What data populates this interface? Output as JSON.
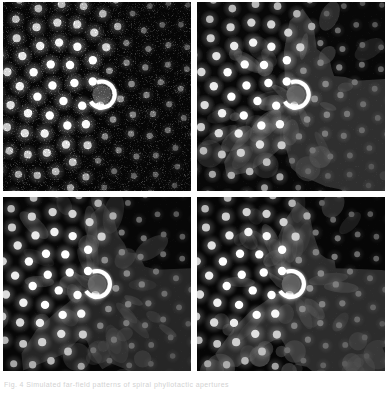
{
  "figure": {
    "layout": "2x2 grid",
    "background_color": "#ffffff",
    "panel_gap_color": "#ffffff",
    "caption": "Fig. 4  Simulated far-field patterns of spiral phyllotactic apertures",
    "panels": [
      {
        "id": "panel-tl",
        "position": "top-left",
        "label": "(a)",
        "description": "High-contrast speckled diffraction pattern, bright spiral dot lattice on noisy black field",
        "background_color": "#060606",
        "dot_color": "#ffffff",
        "halo_color": "#9a9a9a",
        "noise_level": 0.55,
        "noise_color": "#3a3a3a",
        "blur_px": 0.0,
        "lobe_opacity": 0.0,
        "center_x_frac": 0.525,
        "center_y_frac": 0.49,
        "ring_radius_px": 13,
        "ring_thickness_px": 4
      },
      {
        "id": "panel-tr",
        "position": "top-right",
        "label": "(b)",
        "description": "Smoothed reconstruction, bright spiral dots over broad grey lobes on black",
        "background_color": "#080808",
        "dot_color": "#ffffff",
        "halo_color": "#8a8a8a",
        "noise_level": 0.1,
        "noise_color": "#2a2a2a",
        "blur_px": 0.6,
        "lobe_opacity": 0.52,
        "lobe_color": "#555555",
        "center_x_frac": 0.525,
        "center_y_frac": 0.49,
        "ring_radius_px": 13,
        "ring_thickness_px": 4
      },
      {
        "id": "panel-bl",
        "position": "bottom-left",
        "label": "(c)",
        "description": "Lower-intensity reconstruction with large dark grey lobe covering lower-left quadrant",
        "background_color": "#070707",
        "dot_color": "#f4f4f4",
        "halo_color": "#7c7c7c",
        "noise_level": 0.08,
        "noise_color": "#282828",
        "blur_px": 0.8,
        "lobe_opacity": 0.46,
        "lobe_color": "#4d4d4d",
        "center_x_frac": 0.5,
        "center_y_frac": 0.5,
        "ring_radius_px": 13,
        "ring_thickness_px": 4
      },
      {
        "id": "panel-br",
        "position": "bottom-right",
        "label": "(d)",
        "description": "Reconstruction with prominent large diffuse blobs in lower half and bright spiral dots above",
        "background_color": "#060606",
        "dot_color": "#ffffff",
        "halo_color": "#8f8f8f",
        "noise_level": 0.07,
        "noise_color": "#262626",
        "blur_px": 0.9,
        "lobe_opacity": 0.5,
        "lobe_color": "#525252",
        "center_x_frac": 0.5,
        "center_y_frac": 0.5,
        "ring_radius_px": 13,
        "ring_thickness_px": 4
      }
    ]
  },
  "chart_data": {
    "type": "scatter",
    "xlabel": "",
    "ylabel": "",
    "xlim": [
      -1,
      1
    ],
    "ylim": [
      -1,
      1
    ],
    "grid": false,
    "legend_position": "none",
    "generator": {
      "model": "fermat-spiral-phyllotaxis",
      "golden_angle_deg": 137.508,
      "n_points": 210,
      "radius_scale": 11.2,
      "radius_exponent": 0.5,
      "dot_radius_min_px": 1.6,
      "dot_radius_max_px": 4.2,
      "brightness_falloff": 1.45,
      "angular_bright_sector_deg": [
        95,
        285
      ],
      "center_ring": {
        "radius_px": 13,
        "thickness_px": 4,
        "gap_angle_deg": [
          300,
          40
        ]
      }
    },
    "series": [
      {
        "name": "panel (a) speckled",
        "n_points": 210,
        "peak_intensity": 1.0,
        "noise": 0.55
      },
      {
        "name": "panel (b) smoothed",
        "n_points": 210,
        "peak_intensity": 0.95,
        "noise": 0.1
      },
      {
        "name": "panel (c) low-contrast",
        "n_points": 210,
        "peak_intensity": 0.86,
        "noise": 0.08
      },
      {
        "name": "panel (d) blobbed",
        "n_points": 210,
        "peak_intensity": 0.92,
        "noise": 0.07
      }
    ]
  }
}
